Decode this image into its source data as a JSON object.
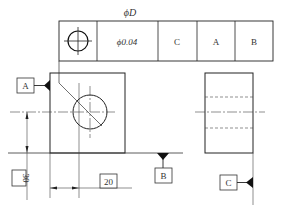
{
  "diagram": {
    "type": "engineering-drawing-gd&t",
    "colors": {
      "line": "#222222",
      "thin_line": "#555555",
      "text": "#333333",
      "background": "#ffffff"
    },
    "feature_control_frame": {
      "label_above": "ϕD",
      "symbol": "position-icon",
      "tolerance": "ϕ0.04",
      "datums": [
        "C",
        "A",
        "B"
      ]
    },
    "datum_labels": {
      "a": "A",
      "b": "B",
      "c": "C"
    },
    "dimensions": {
      "vertical": "30",
      "horizontal": "20"
    },
    "views": {
      "front": "front-view-square-with-hole",
      "side": "side-view-rectangle-with-hidden-hole"
    }
  }
}
